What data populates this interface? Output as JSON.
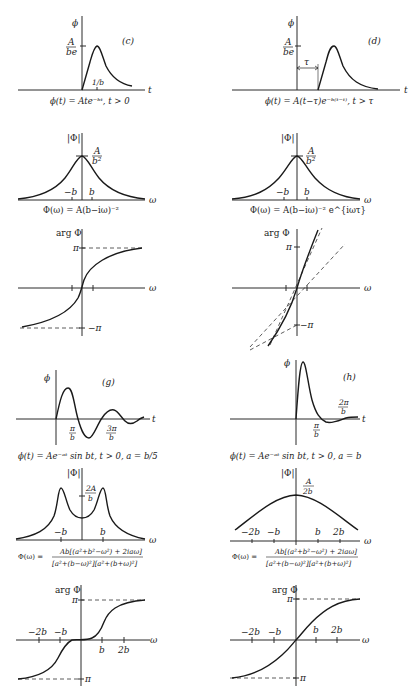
{
  "panels": {
    "c": {
      "tag": "(c)",
      "y_axis": "ϕ",
      "x_axis": "t",
      "peak_label_num": "A",
      "peak_label_den": "be",
      "tick_label": "1/b",
      "caption": "ϕ(t) = Ate⁻ᵇᵗ, t > 0"
    },
    "d": {
      "tag": "(d)",
      "y_axis": "ϕ",
      "x_axis": "t",
      "peak_label_num": "A",
      "peak_label_den": "be",
      "delay_label": "τ",
      "caption": "ϕ(t) = A(t−τ)e⁻ᵇ⁽ᵗ⁻ᵗ⁾, t > τ"
    },
    "c_mag": {
      "y_axis": "|Φ|",
      "x_axis": "ω",
      "peak_num": "A",
      "peak_den": "b²",
      "ticks": [
        "−b",
        "b"
      ],
      "caption": "Φ(ω) = A(b−iω)⁻²"
    },
    "d_mag": {
      "y_axis": "|Φ|",
      "x_axis": "ω",
      "peak_num": "A",
      "peak_den": "b²",
      "ticks": [
        "−b",
        "b"
      ],
      "caption": "Φ(ω) = A(b−iω)⁻² e^{iωτ}"
    },
    "c_arg": {
      "y_axis": "arg Φ",
      "x_axis": "ω",
      "top": "π",
      "bottom": "−π"
    },
    "d_arg": {
      "y_axis": "arg Φ",
      "x_axis": "ω",
      "top": "π",
      "bottom": "−π"
    },
    "g": {
      "tag": "(g)",
      "y_axis": "ϕ",
      "x_axis": "t",
      "tick1_num": "π",
      "tick1_den": "b",
      "tick2_num": "3π",
      "tick2_den": "b",
      "caption": "ϕ(t) = Ae⁻ᵃᵗ sin bt, t > 0, a = b/5"
    },
    "h": {
      "tag": "(h)",
      "y_axis": "ϕ",
      "x_axis": "t",
      "tick1_num": "π",
      "tick1_den": "b",
      "tick2_num": "2π",
      "tick2_den": "b",
      "caption": "ϕ(t) = Ae⁻ᵃᵗ sin bt, t > 0, a = b"
    },
    "g_mag": {
      "y_axis": "|Φ|",
      "x_axis": "ω",
      "mark_num": "2A",
      "mark_den": "b",
      "ticks": [
        "−b",
        "b"
      ],
      "caption_lhs": "Φ(ω) =",
      "caption_num": "Ab[(a²+b²−ω²) + 2iaω]",
      "caption_den": "[a²+(b−ω)²][a²+(b+ω)²]"
    },
    "h_mag": {
      "y_axis": "|Φ|",
      "x_axis": "ω",
      "peak_num": "A",
      "peak_den": "2b",
      "ticks": [
        "−2b",
        "−b",
        "b",
        "2b"
      ],
      "caption_lhs": "Φ(ω) =",
      "caption_num": "Ab[(a²+b²−ω²) + 2iaω]",
      "caption_den": "[a²+(b−ω)²][a²+(b+ω)²]"
    },
    "g_arg": {
      "y_axis": "arg Φ",
      "x_axis": "ω",
      "top": "π",
      "bottom": "π",
      "ticks": [
        "−2b",
        "−b",
        "b",
        "2b"
      ]
    },
    "h_arg": {
      "y_axis": "arg Φ",
      "x_axis": "ω",
      "top": "π",
      "bottom": "π",
      "ticks": [
        "−2b",
        "−b",
        "b",
        "2b"
      ]
    }
  }
}
